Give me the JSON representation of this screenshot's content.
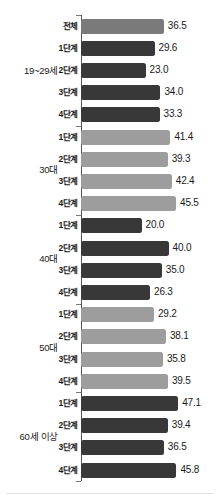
{
  "chart_data": {
    "type": "bar",
    "orientation": "horizontal",
    "title": "",
    "xlabel": "",
    "ylabel": "",
    "xlim": [
      0,
      50
    ],
    "grid": false,
    "legend": false,
    "groups": [
      {
        "name": "19~29세",
        "shade": "dark",
        "bars": [
          {
            "category": "전체",
            "value": 36.5,
            "label": "36.5",
            "shade": "total"
          },
          {
            "category": "1단계",
            "value": 29.6,
            "label": "29.6",
            "shade": "dark"
          },
          {
            "category": "2단계",
            "value": 23.0,
            "label": "23.0",
            "shade": "dark"
          },
          {
            "category": "3단계",
            "value": 34.0,
            "label": "34.0",
            "shade": "dark"
          },
          {
            "category": "4단계",
            "value": 33.3,
            "label": "33.3",
            "shade": "dark"
          }
        ]
      },
      {
        "name": "30대",
        "shade": "light",
        "bars": [
          {
            "category": "1단계",
            "value": 41.4,
            "label": "41.4",
            "shade": "light"
          },
          {
            "category": "2단계",
            "value": 39.3,
            "label": "39.3",
            "shade": "light"
          },
          {
            "category": "3단계",
            "value": 42.4,
            "label": "42.4",
            "shade": "light"
          },
          {
            "category": "4단계",
            "value": 45.5,
            "label": "45.5",
            "shade": "light"
          }
        ]
      },
      {
        "name": "40대",
        "shade": "dark",
        "bars": [
          {
            "category": "1단계",
            "value": 20.0,
            "label": "20.0",
            "shade": "dark"
          },
          {
            "category": "2단계",
            "value": 40.0,
            "label": "40.0",
            "shade": "dark"
          },
          {
            "category": "3단계",
            "value": 35.0,
            "label": "35.0",
            "shade": "dark"
          },
          {
            "category": "4단계",
            "value": 26.3,
            "label": "26.3",
            "shade": "dark"
          }
        ]
      },
      {
        "name": "50대",
        "shade": "light",
        "bars": [
          {
            "category": "1단계",
            "value": 29.2,
            "label": "29.2",
            "shade": "light"
          },
          {
            "category": "2단계",
            "value": 38.1,
            "label": "38.1",
            "shade": "light"
          },
          {
            "category": "3단계",
            "value": 35.8,
            "label": "35.8",
            "shade": "light"
          },
          {
            "category": "4단계",
            "value": 39.5,
            "label": "39.5",
            "shade": "light"
          }
        ]
      },
      {
        "name": "60세 이상",
        "shade": "dark",
        "bars": [
          {
            "category": "1단계",
            "value": 47.1,
            "label": "47.1",
            "shade": "dark"
          },
          {
            "category": "2단계",
            "value": 39.4,
            "label": "39.4",
            "shade": "dark"
          },
          {
            "category": "3단계",
            "value": 36.5,
            "label": "36.5",
            "shade": "dark"
          },
          {
            "category": "4단계",
            "value": 45.8,
            "label": "45.8",
            "shade": "dark"
          }
        ]
      }
    ],
    "colors": {
      "dark": "#383838",
      "light": "#9d9d9d",
      "total": "#7a7a7a",
      "axis": "#555555",
      "text": "#1a1a1a",
      "background": "#ffffff"
    }
  }
}
